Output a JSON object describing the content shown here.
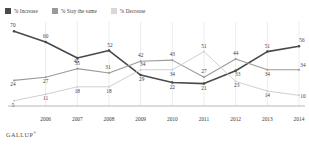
{
  "legend": {
    "items": [
      {
        "label": "% Increase",
        "color": "#4a4a4a"
      },
      {
        "label": "% Stay the same",
        "color": "#9a9a9a"
      },
      {
        "label": "% Decrease",
        "color": "#d0d0d0"
      }
    ]
  },
  "source": {
    "brand": "GALLUP",
    "trademark": "®"
  },
  "chart_data": {
    "type": "line",
    "title": "",
    "xlabel": "",
    "ylabel": "",
    "grid": true,
    "legend_position": "top-left",
    "ylim": [
      0,
      75
    ],
    "x": [
      2005,
      2006,
      2007,
      2008,
      2009,
      2010,
      2011,
      2012,
      2013,
      2014
    ],
    "categories": [
      "",
      "2006",
      "2007",
      "2008",
      "2009",
      "2010",
      "2011",
      "2012",
      "2013",
      "2014"
    ],
    "tick_labels": [
      "2006",
      "2007",
      "2008",
      "2009",
      "2010",
      "2011",
      "2012",
      "2013",
      "2014"
    ],
    "series": [
      {
        "name": "% Increase",
        "color": "#4a4a4a",
        "values": [
          70,
          60,
          45,
          52,
          29,
          22,
          21,
          33,
          51,
          56
        ],
        "labels": [
          "70",
          "60",
          "45",
          "52",
          "29",
          "22",
          "21",
          "33",
          "51",
          "56"
        ]
      },
      {
        "name": "% Stay the same",
        "color": "#9a9a9a",
        "values": [
          24,
          27,
          35,
          31,
          42,
          43,
          27,
          44,
          34,
          34
        ],
        "labels": [
          "24",
          "27",
          "35",
          "31",
          "42",
          "43",
          "27",
          "44",
          "34",
          "34"
        ]
      },
      {
        "name": "% Decrease",
        "color": "#d0d0d0",
        "values": [
          5,
          11,
          18,
          18,
          34,
          34,
          51,
          23,
          14,
          10
        ],
        "labels": [
          "5",
          "11",
          "18",
          "18",
          "34",
          "34",
          "51",
          "23",
          "14",
          "10"
        ]
      }
    ]
  }
}
